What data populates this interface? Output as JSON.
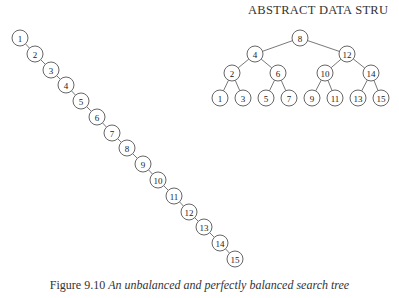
{
  "header": {
    "running_title": "ABSTRACT DATA STRU"
  },
  "figure": {
    "caption_label": "Figure 9.10",
    "caption_text": "An unbalanced and perfectly balanced search tree",
    "unbalanced_tree": {
      "nodes": [
        {
          "id": 1,
          "x": 20,
          "y": 38
        },
        {
          "id": 2,
          "x": 35,
          "y": 54
        },
        {
          "id": 3,
          "x": 51,
          "y": 70
        },
        {
          "id": 4,
          "x": 66,
          "y": 85
        },
        {
          "id": 5,
          "x": 81,
          "y": 101
        },
        {
          "id": 6,
          "x": 97,
          "y": 117
        },
        {
          "id": 7,
          "x": 112,
          "y": 133
        },
        {
          "id": 8,
          "x": 127,
          "y": 148
        },
        {
          "id": 9,
          "x": 143,
          "y": 164
        },
        {
          "id": 10,
          "x": 158,
          "y": 180
        },
        {
          "id": 11,
          "x": 174,
          "y": 196
        },
        {
          "id": 12,
          "x": 189,
          "y": 212
        },
        {
          "id": 13,
          "x": 204,
          "y": 227
        },
        {
          "id": 14,
          "x": 220,
          "y": 243
        },
        {
          "id": 15,
          "x": 235,
          "y": 259
        }
      ]
    },
    "balanced_tree": {
      "nodes": [
        {
          "id": 8,
          "x": 300,
          "y": 38
        },
        {
          "id": 4,
          "x": 255,
          "y": 54
        },
        {
          "id": 12,
          "x": 347,
          "y": 54
        },
        {
          "id": 2,
          "x": 232,
          "y": 73
        },
        {
          "id": 6,
          "x": 278,
          "y": 73
        },
        {
          "id": 10,
          "x": 325,
          "y": 73
        },
        {
          "id": 14,
          "x": 371,
          "y": 73
        },
        {
          "id": 1,
          "x": 220,
          "y": 98
        },
        {
          "id": 3,
          "x": 243,
          "y": 98
        },
        {
          "id": 5,
          "x": 266,
          "y": 98
        },
        {
          "id": 7,
          "x": 289,
          "y": 98
        },
        {
          "id": 9,
          "x": 312,
          "y": 98
        },
        {
          "id": 11,
          "x": 335,
          "y": 98
        },
        {
          "id": 13,
          "x": 358,
          "y": 98
        },
        {
          "id": 15,
          "x": 381,
          "y": 98
        }
      ],
      "edges": [
        [
          8,
          4
        ],
        [
          8,
          12
        ],
        [
          4,
          2
        ],
        [
          4,
          6
        ],
        [
          12,
          10
        ],
        [
          12,
          14
        ],
        [
          2,
          1
        ],
        [
          2,
          3
        ],
        [
          6,
          5
        ],
        [
          6,
          7
        ],
        [
          10,
          9
        ],
        [
          10,
          11
        ],
        [
          14,
          13
        ],
        [
          14,
          15
        ]
      ]
    }
  }
}
